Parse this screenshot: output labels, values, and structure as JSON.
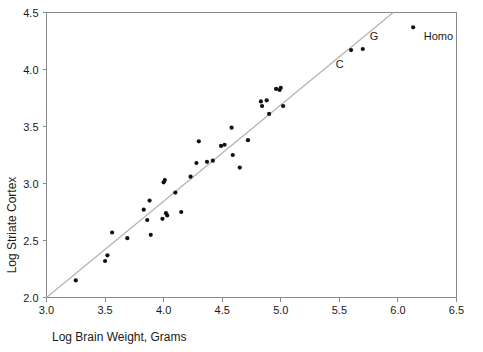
{
  "chart_data": {
    "type": "scatter",
    "title": "",
    "xlabel": "Log Brain Weight, Grams",
    "ylabel": "Log Striate Cortex",
    "xlim": [
      3.0,
      6.5
    ],
    "ylim": [
      2.0,
      4.5
    ],
    "xticks": [
      "3.0",
      "3.5",
      "4.0",
      "4.5",
      "5.0",
      "5.5",
      "6.0",
      "6.5"
    ],
    "xtick_values": [
      3.0,
      3.5,
      4.0,
      4.5,
      5.0,
      5.5,
      6.0,
      6.5
    ],
    "yticks": [
      "2.0",
      "2.5",
      "3.0",
      "3.5",
      "4.0",
      "4.5"
    ],
    "ytick_values": [
      2.0,
      2.5,
      3.0,
      3.5,
      4.0,
      4.5
    ],
    "grid": false,
    "legend": "none",
    "marker_color": "#111111",
    "fit_line_color": "#b0b0b0",
    "axis_color": "#8a8a8a",
    "fit_line": {
      "label": "regression line",
      "x_start": 3.0,
      "y_start": 2.0,
      "x_end": 5.96,
      "y_end": 4.5
    },
    "points": [
      [
        3.25,
        2.15
      ],
      [
        3.5,
        2.32
      ],
      [
        3.52,
        2.37
      ],
      [
        3.56,
        2.57
      ],
      [
        3.69,
        2.52
      ],
      [
        3.83,
        2.77
      ],
      [
        3.86,
        2.68
      ],
      [
        3.88,
        2.85
      ],
      [
        3.89,
        2.55
      ],
      [
        3.99,
        2.69
      ],
      [
        4.0,
        3.01
      ],
      [
        4.01,
        3.03
      ],
      [
        4.02,
        2.74
      ],
      [
        4.03,
        2.72
      ],
      [
        4.1,
        2.92
      ],
      [
        4.15,
        2.75
      ],
      [
        4.23,
        3.06
      ],
      [
        4.28,
        3.18
      ],
      [
        4.3,
        3.37
      ],
      [
        4.37,
        3.19
      ],
      [
        4.42,
        3.2
      ],
      [
        4.49,
        3.33
      ],
      [
        4.52,
        3.34
      ],
      [
        4.58,
        3.49
      ],
      [
        4.59,
        3.25
      ],
      [
        4.65,
        3.14
      ],
      [
        4.72,
        3.38
      ],
      [
        4.83,
        3.72
      ],
      [
        4.84,
        3.68
      ],
      [
        4.88,
        3.73
      ],
      [
        4.9,
        3.61
      ],
      [
        4.96,
        3.83
      ],
      [
        4.99,
        3.82
      ],
      [
        5.0,
        3.84
      ],
      [
        5.02,
        3.68
      ],
      [
        5.6,
        4.17
      ],
      [
        5.7,
        4.18
      ],
      [
        6.13,
        4.37
      ]
    ],
    "annotations": [
      {
        "text": "C",
        "x": 5.47,
        "y": 4.01,
        "name": "annotation-c"
      },
      {
        "text": "G",
        "x": 5.76,
        "y": 4.26,
        "name": "annotation-g"
      },
      {
        "text": "Homo",
        "x": 6.22,
        "y": 4.26,
        "name": "annotation-homo"
      }
    ]
  }
}
